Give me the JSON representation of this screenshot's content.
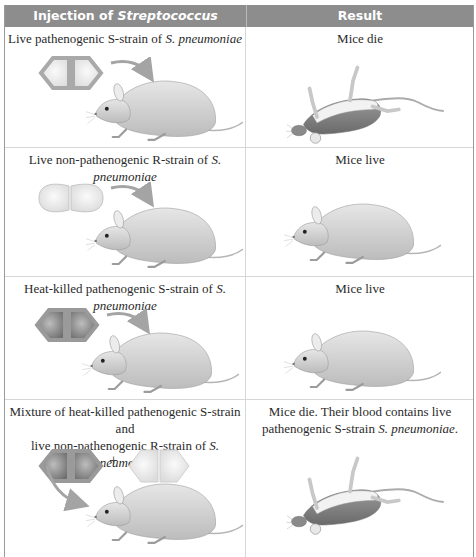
{
  "table": {
    "headers": {
      "injection_prefix": "Injection of ",
      "injection_species": "Streptococcus pneumoniae",
      "result": "Result"
    },
    "rows": [
      {
        "injection_text": "Live pathenogenic S-strain of ",
        "injection_species": "S. pneumoniae",
        "injection_line2": "",
        "bacteria": [
          "S-strain live (gray capsule)"
        ],
        "result_text": "Mice die",
        "result_line2_text": "",
        "result_line2_species": "",
        "result_image": "dead-mouse"
      },
      {
        "injection_text": "Live non-pathenogenic R-strain of ",
        "injection_species": "S. pneumoniae",
        "injection_line2": "",
        "bacteria": [
          "R-strain live (no capsule)"
        ],
        "result_text": "Mice live",
        "result_line2_text": "",
        "result_line2_species": "",
        "result_image": "live-mouse"
      },
      {
        "injection_text": "Heat-killed pathenogenic S-strain of ",
        "injection_species": "S. pneumoniae",
        "injection_line2": "",
        "bacteria": [
          "S-strain heat-killed (dark)"
        ],
        "result_text": "Mice live",
        "result_line2_text": "",
        "result_line2_species": "",
        "result_image": "live-mouse"
      },
      {
        "injection_text": "Mixture of heat-killed pathenogenic S-strain and",
        "injection_line2": "live non-pathenogenic R-strain of ",
        "injection_species": "S. pneumoniae",
        "bacteria": [
          "S-strain heat-killed (dark)",
          "R-strain live (no capsule)"
        ],
        "plus": "+",
        "result_text": "Mice die. Their blood contains live",
        "result_line2_text": "pathenogenic S-strain ",
        "result_line2_species": "S. pneumoniae",
        "result_line2_end": ".",
        "result_image": "dead-mouse"
      }
    ]
  },
  "colors": {
    "header_bg": "#8d8d8d",
    "header_text": "#ffffff",
    "grid": "#d6d6d6",
    "outer_border": "#9a9a9a"
  }
}
